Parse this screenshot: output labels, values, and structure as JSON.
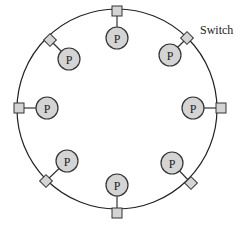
{
  "diagram": {
    "type": "ring-interconnect",
    "ring": {
      "cx": 117,
      "cy": 109,
      "r": 100,
      "stroke": "#222222"
    },
    "switch_label": {
      "text": "Switch",
      "x": 200,
      "y": 34
    },
    "colors": {
      "node_fill": "#d4d4d4",
      "switch_fill": "#d4d4d4",
      "stroke": "#333333"
    },
    "nodes": [
      {
        "id": "top",
        "switch_shape": "square",
        "sx": 117,
        "sy": 11,
        "px": 117,
        "py": 38,
        "label": "P"
      },
      {
        "id": "top-right",
        "switch_shape": "diamond",
        "sx": 187,
        "sy": 38,
        "px": 170,
        "py": 55,
        "label": "P"
      },
      {
        "id": "right",
        "switch_shape": "square",
        "sx": 221,
        "sy": 108,
        "px": 193,
        "py": 108,
        "label": "P"
      },
      {
        "id": "bottom-right",
        "switch_shape": "diamond",
        "sx": 191,
        "sy": 183,
        "px": 172,
        "py": 163,
        "label": "P"
      },
      {
        "id": "bottom",
        "switch_shape": "square",
        "sx": 117,
        "sy": 213,
        "px": 117,
        "py": 185,
        "label": "P"
      },
      {
        "id": "bottom-left",
        "switch_shape": "diamond",
        "sx": 46,
        "sy": 181,
        "px": 67,
        "py": 161,
        "label": "P"
      },
      {
        "id": "left",
        "switch_shape": "square",
        "sx": 19,
        "sy": 108,
        "px": 47,
        "py": 108,
        "label": "P"
      },
      {
        "id": "top-left",
        "switch_shape": "diamond",
        "sx": 50,
        "sy": 40,
        "px": 69,
        "py": 59,
        "label": "P"
      }
    ]
  }
}
